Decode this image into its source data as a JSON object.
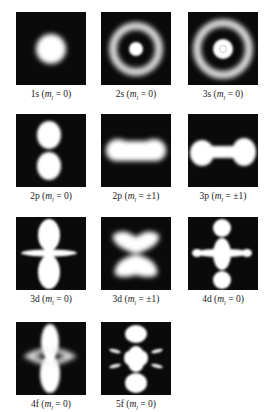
{
  "figure": {
    "colors": {
      "background": "#ffffff",
      "panel": "#0a0a0a",
      "density": "#ffffff"
    },
    "orbitals": [
      {
        "id": "1s",
        "n_l": "1s",
        "ml": "0",
        "label": "1s (m_l = 0)"
      },
      {
        "id": "2s",
        "n_l": "2s",
        "ml": "0",
        "label": "2s (m_l = 0)"
      },
      {
        "id": "3s",
        "n_l": "3s",
        "ml": "0",
        "label": "3s (m_l = 0)"
      },
      {
        "id": "2p0",
        "n_l": "2p",
        "ml": "0",
        "label": "2p (m_l = 0)"
      },
      {
        "id": "2p1",
        "n_l": "2p",
        "ml": "±1",
        "label": "2p (m_l = ±1)"
      },
      {
        "id": "3p1",
        "n_l": "3p",
        "ml": "±1",
        "label": "3p (m_l = ±1)"
      },
      {
        "id": "3d0",
        "n_l": "3d",
        "ml": "0",
        "label": "3d (m_l = 0)"
      },
      {
        "id": "3d1",
        "n_l": "3d",
        "ml": "±1",
        "label": "3d (m_l = ±1)"
      },
      {
        "id": "4d0",
        "n_l": "4d",
        "ml": "0",
        "label": "4d (m_l = 0)"
      },
      {
        "id": "4f0",
        "n_l": "4f",
        "ml": "0",
        "label": "4f (m_l = 0)"
      },
      {
        "id": "5f0",
        "n_l": "5f",
        "ml": "0",
        "label": "5f (m_l = 0)"
      }
    ],
    "ml_prefix": "(m",
    "ml_sub": "l",
    "ml_eq": " = ",
    "ml_suffix": ")"
  }
}
